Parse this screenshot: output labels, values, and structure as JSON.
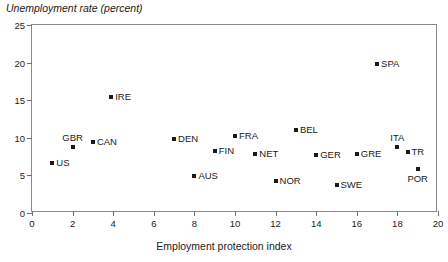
{
  "chart_data": {
    "type": "scatter",
    "title": "Unemployment rate (percent)",
    "xlabel": "Employment protection index",
    "ylabel": "Unemployment rate (percent)",
    "xlim": [
      0,
      20
    ],
    "ylim": [
      0,
      25
    ],
    "xticks": [
      0,
      2,
      4,
      6,
      8,
      10,
      12,
      14,
      16,
      18,
      20
    ],
    "yticks": [
      0,
      5,
      10,
      15,
      20,
      25
    ],
    "grid": false,
    "legend": null,
    "marker_color": "#1a1a1a",
    "axis_color": "#8a8a8a",
    "points": [
      {
        "label": "US",
        "x": 1.0,
        "y": 6.7,
        "label_pos": "right"
      },
      {
        "label": "GBR",
        "x": 2.0,
        "y": 8.8,
        "label_pos": "above"
      },
      {
        "label": "CAN",
        "x": 3.0,
        "y": 9.5,
        "label_pos": "right"
      },
      {
        "label": "IRE",
        "x": 3.9,
        "y": 15.4,
        "label_pos": "right"
      },
      {
        "label": "DEN",
        "x": 7.0,
        "y": 9.8,
        "label_pos": "right"
      },
      {
        "label": "AUS",
        "x": 8.0,
        "y": 4.9,
        "label_pos": "right"
      },
      {
        "label": "FIN",
        "x": 9.0,
        "y": 8.3,
        "label_pos": "right"
      },
      {
        "label": "FRA",
        "x": 10.0,
        "y": 10.2,
        "label_pos": "right"
      },
      {
        "label": "NET",
        "x": 11.0,
        "y": 7.8,
        "label_pos": "right"
      },
      {
        "label": "NOR",
        "x": 12.0,
        "y": 4.2,
        "label_pos": "right"
      },
      {
        "label": "BEL",
        "x": 13.0,
        "y": 11.1,
        "label_pos": "right"
      },
      {
        "label": "GER",
        "x": 14.0,
        "y": 7.7,
        "label_pos": "right"
      },
      {
        "label": "SWE",
        "x": 15.0,
        "y": 3.7,
        "label_pos": "right"
      },
      {
        "label": "GRE",
        "x": 16.0,
        "y": 7.8,
        "label_pos": "right"
      },
      {
        "label": "SPA",
        "x": 17.0,
        "y": 19.8,
        "label_pos": "right"
      },
      {
        "label": "ITA",
        "x": 18.0,
        "y": 8.8,
        "label_pos": "above"
      },
      {
        "label": "TR",
        "x": 18.5,
        "y": 8.1,
        "label_pos": "right"
      },
      {
        "label": "POR",
        "x": 19.0,
        "y": 5.8,
        "label_pos": "below"
      }
    ]
  }
}
